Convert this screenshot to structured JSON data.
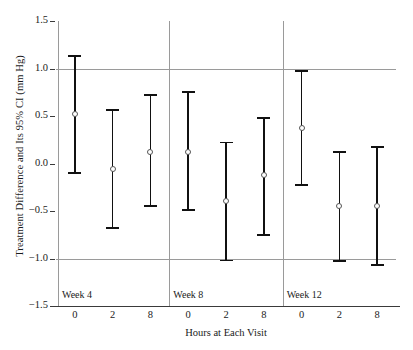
{
  "chart_data": {
    "type": "scatter",
    "title": "",
    "xlabel": "Hours at Each Visit",
    "ylabel": "Treatment Difference and Its 95% CI (mm Hg)",
    "ylim": [
      -1.5,
      1.5
    ],
    "yticks": [
      1.5,
      1.0,
      0.5,
      0.0,
      -0.5,
      -1.0,
      -1.5
    ],
    "ytick_labels": [
      "1.5",
      "1.0",
      "0.5",
      "0.0",
      "−0.5",
      "−1.0",
      "−1.5"
    ],
    "categories": [
      "0",
      "2",
      "8",
      "0",
      "2",
      "8",
      "0",
      "2",
      "8"
    ],
    "group_labels": [
      "Week 4",
      "Week 8",
      "Week 12"
    ],
    "grid": "horizontal reference lines at y = 1.0 and y = -1.0; vertical separators between week groups",
    "legend": "none",
    "marker": "open circle",
    "series": [
      {
        "name": "Treatment difference (95% CI)",
        "points": [
          {
            "group": "Week 4",
            "hour": "0",
            "estimate": 0.52,
            "ci_low": -0.1,
            "ci_high": 1.13
          },
          {
            "group": "Week 4",
            "hour": "2",
            "estimate": -0.06,
            "ci_low": -0.68,
            "ci_high": 0.56
          },
          {
            "group": "Week 4",
            "hour": "8",
            "estimate": 0.12,
            "ci_low": -0.45,
            "ci_high": 0.72
          },
          {
            "group": "Week 8",
            "hour": "0",
            "estimate": 0.12,
            "ci_low": -0.49,
            "ci_high": 0.75
          },
          {
            "group": "Week 8",
            "hour": "2",
            "estimate": -0.39,
            "ci_low": -1.02,
            "ci_high": 0.22
          },
          {
            "group": "Week 8",
            "hour": "8",
            "estimate": -0.12,
            "ci_low": -0.75,
            "ci_high": 0.48
          },
          {
            "group": "Week 12",
            "hour": "0",
            "estimate": 0.37,
            "ci_low": -0.23,
            "ci_high": 0.97
          },
          {
            "group": "Week 12",
            "hour": "2",
            "estimate": -0.45,
            "ci_low": -1.03,
            "ci_high": 0.12
          },
          {
            "group": "Week 12",
            "hour": "8",
            "estimate": -0.45,
            "ci_low": -1.07,
            "ci_high": 0.17
          }
        ]
      }
    ],
    "reference_lines": [
      1.0,
      -1.0
    ]
  },
  "axes": {
    "ylabel": "Treatment Difference and Its 95% CI (mm Hg)",
    "xlabel": "Hours at Each Visit",
    "ytick_labels": [
      "1.5",
      "1.0",
      "0.5",
      "0.0",
      "−0.5",
      "−1.0",
      "−1.5"
    ],
    "xtick_labels": [
      "0",
      "2",
      "8",
      "0",
      "2",
      "8",
      "0",
      "2",
      "8"
    ],
    "group_labels": [
      "Week 4",
      "Week 8",
      "Week 12"
    ]
  },
  "colors": {
    "bar": "#111111",
    "marker_edge": "#555555",
    "reference_line": "#9a9a9a",
    "axis": "#3a3a3a",
    "background": "#ffffff"
  }
}
